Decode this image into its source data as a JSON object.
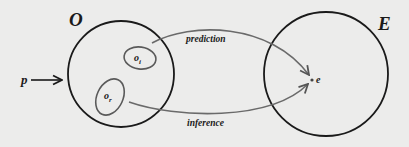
{
  "diagram": {
    "colors": {
      "background": "#ececeb",
      "outline": "#1a1a1a",
      "subset_stroke": "#5a5a5a",
      "arrow_stroke": "#6a6a6a"
    },
    "sets": [
      {
        "id": "O",
        "label": "O",
        "shape": "circle"
      },
      {
        "id": "E",
        "label": "E",
        "shape": "circle"
      }
    ],
    "subsets": [
      {
        "id": "o_i",
        "label": "o",
        "subscript": "i",
        "parent": "O"
      },
      {
        "id": "o_r",
        "label": "o",
        "subscript": "r",
        "parent": "O"
      }
    ],
    "input": {
      "label": "p",
      "target": "O"
    },
    "point": {
      "label": "e",
      "parent": "E"
    },
    "edges": [
      {
        "from": "o_i",
        "to": "e",
        "label": "prediction"
      },
      {
        "from": "o_r",
        "to": "e",
        "label": "inference"
      }
    ]
  }
}
